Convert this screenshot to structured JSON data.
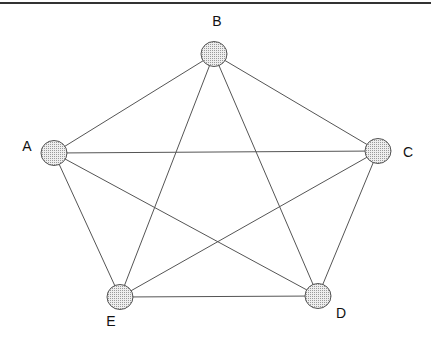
{
  "diagram": {
    "type": "complete-graph",
    "nodes": [
      {
        "id": "A",
        "label": "A",
        "cx": 54,
        "cy": 153,
        "lx": 27,
        "ly": 146
      },
      {
        "id": "B",
        "label": "B",
        "cx": 214,
        "cy": 54,
        "lx": 217,
        "ly": 21
      },
      {
        "id": "C",
        "label": "C",
        "cx": 378,
        "cy": 151,
        "lx": 408,
        "ly": 152
      },
      {
        "id": "D",
        "label": "D",
        "cx": 318,
        "cy": 296,
        "lx": 341,
        "ly": 313
      },
      {
        "id": "E",
        "label": "E",
        "cx": 120,
        "cy": 297,
        "lx": 111,
        "ly": 321
      }
    ],
    "edges": [
      [
        "A",
        "B"
      ],
      [
        "A",
        "C"
      ],
      [
        "A",
        "D"
      ],
      [
        "A",
        "E"
      ],
      [
        "B",
        "C"
      ],
      [
        "B",
        "D"
      ],
      [
        "B",
        "E"
      ],
      [
        "C",
        "D"
      ],
      [
        "C",
        "E"
      ],
      [
        "D",
        "E"
      ]
    ],
    "node_fill": "#d8d8d8",
    "stroke": "#555555"
  }
}
